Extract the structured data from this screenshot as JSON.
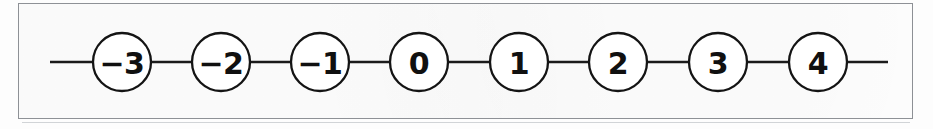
{
  "figure": {
    "kind": "number-line-diagram",
    "width": 933,
    "height": 129
  },
  "frame": {
    "stroke_color": "#8e9196",
    "fill_color": "#fefefe",
    "x": 18,
    "y": 3,
    "width": 895,
    "height": 116
  },
  "line": {
    "color": "#1b1b1b",
    "thickness": 2.3,
    "y": 62,
    "left_tail_start_x": 50,
    "right_tail_end_x": 888
  },
  "nodes": [
    {
      "label": "−3",
      "value": -3,
      "cx": 122,
      "cy": 62,
      "r": 29
    },
    {
      "label": "−2",
      "value": -2,
      "cx": 221,
      "cy": 62,
      "r": 29
    },
    {
      "label": "−1",
      "value": -1,
      "cx": 320,
      "cy": 62,
      "r": 29
    },
    {
      "label": "0",
      "value": 0,
      "cx": 419,
      "cy": 62,
      "r": 29
    },
    {
      "label": "1",
      "value": 1,
      "cx": 519,
      "cy": 62,
      "r": 29
    },
    {
      "label": "2",
      "value": 2,
      "cx": 618,
      "cy": 62,
      "r": 29
    },
    {
      "label": "3",
      "value": 3,
      "cx": 718,
      "cy": 62,
      "r": 29
    },
    {
      "label": "4",
      "value": 4,
      "cx": 818,
      "cy": 62,
      "r": 29
    }
  ],
  "colors": {
    "node_stroke": "#141414",
    "node_fill": "#ffffff",
    "label_text": "#101010",
    "background": "#fdfdfd"
  }
}
